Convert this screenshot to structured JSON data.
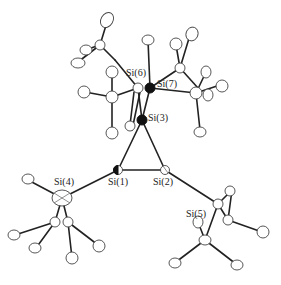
{
  "diagram": {
    "type": "ORTEP molecular structure",
    "atoms": [
      {
        "id": "si1",
        "label": "Si(1)",
        "x": 118,
        "y": 170,
        "lx": 108,
        "ly": 183
      },
      {
        "id": "si2",
        "label": "Si(2)",
        "x": 165,
        "y": 170,
        "lx": 155,
        "ly": 183
      },
      {
        "id": "si3",
        "label": "Si(3)",
        "x": 142,
        "y": 120,
        "lx": 150,
        "ly": 115
      },
      {
        "id": "si4",
        "label": "Si(4)",
        "x": 62,
        "y": 198,
        "lx": 58,
        "ly": 183
      },
      {
        "id": "si5",
        "label": "Si(5)",
        "x": 220,
        "y": 205,
        "lx": 185,
        "ly": 210
      },
      {
        "id": "si6",
        "label": "Si(6)",
        "x": 138,
        "y": 88,
        "lx": 128,
        "ly": 68
      },
      {
        "id": "si7",
        "label": "Si(7)",
        "x": 150,
        "y": 88,
        "lx": 157,
        "ly": 78
      }
    ],
    "bonds": [
      [
        "si1",
        "si2"
      ],
      [
        "si1",
        "si3"
      ],
      [
        "si2",
        "si3"
      ],
      [
        "si1",
        "si4"
      ],
      [
        "si2",
        "si5"
      ],
      [
        "si3",
        "si6"
      ],
      [
        "si3",
        "si7"
      ]
    ]
  }
}
